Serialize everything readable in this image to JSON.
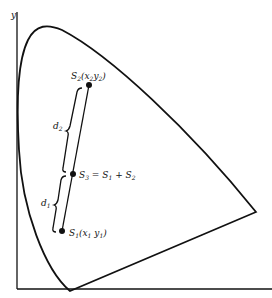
{
  "diagram": {
    "type": "chromaticity-diagram",
    "axis_y_label": "y",
    "points": [
      {
        "id": "S2",
        "label": "S",
        "sub": "2",
        "coord_label": "(x",
        "coord_sub1": "2",
        "coord_mid": "y",
        "coord_sub2": "2",
        "coord_end": ")"
      },
      {
        "id": "S3",
        "label": "S",
        "sub": "3",
        "equation": " = S",
        "eq_sub1": "1",
        "eq_mid": " + S",
        "eq_sub2": "2"
      },
      {
        "id": "S1",
        "label": "S",
        "sub": "1",
        "coord_label": "(x",
        "coord_sub1": "1",
        "coord_mid": " y",
        "coord_sub2": "1",
        "coord_end": ")"
      }
    ],
    "distances": [
      {
        "label": "d",
        "sub": "2"
      },
      {
        "label": "d",
        "sub": "1"
      }
    ],
    "line_color": "#111111"
  }
}
